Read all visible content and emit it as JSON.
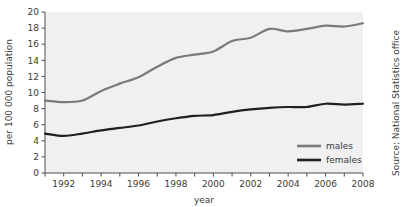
{
  "chart_data": {
    "type": "line",
    "title": "",
    "xlabel": "year",
    "ylabel": "per 100 000 population",
    "x": [
      1991,
      1992,
      1993,
      1994,
      1995,
      1996,
      1997,
      1998,
      1999,
      2000,
      2001,
      2002,
      2003,
      2004,
      2005,
      2006,
      2007,
      2008
    ],
    "xlim": [
      1991,
      2008
    ],
    "ylim": [
      0,
      20
    ],
    "yticks": [
      0,
      2,
      4,
      6,
      8,
      10,
      12,
      14,
      16,
      18,
      20
    ],
    "xticks": [
      1991,
      1992,
      1993,
      1994,
      1995,
      1996,
      1997,
      1998,
      1999,
      2000,
      2001,
      2002,
      2003,
      2004,
      2005,
      2006,
      2007,
      2008
    ],
    "xtick_labels": [
      "",
      "1992",
      "",
      "1994",
      "",
      "1996",
      "",
      "1998",
      "",
      "2000",
      "",
      "2002",
      "",
      "2004",
      "",
      "2006",
      "",
      "2008"
    ],
    "ytick_labels": [
      "0",
      "2",
      "4",
      "6",
      "8",
      "10",
      "12",
      "14",
      "16",
      "18",
      "20"
    ],
    "grid": false,
    "legend_position": "bottom-right",
    "series": [
      {
        "name": "males",
        "color": "#7a7a7a",
        "values": [
          9.0,
          8.8,
          9.0,
          10.2,
          11.1,
          11.9,
          13.2,
          14.3,
          14.7,
          15.1,
          16.4,
          16.8,
          17.9,
          17.6,
          17.9,
          18.3,
          18.2,
          18.6
        ]
      },
      {
        "name": "females",
        "color": "#1f1f1f",
        "values": [
          4.9,
          4.6,
          4.9,
          5.3,
          5.6,
          5.9,
          6.4,
          6.8,
          7.1,
          7.2,
          7.6,
          7.9,
          8.1,
          8.2,
          8.2,
          8.6,
          8.5,
          8.6
        ]
      }
    ],
    "source": "Source: National Statistics office",
    "plot_background": "#f0f0f0",
    "axis_color": "#4d4d4d"
  },
  "legend": {
    "items": [
      {
        "label": "males"
      },
      {
        "label": "females"
      }
    ]
  },
  "axes": {
    "x_title": "year",
    "y_title": "per 100 000 population"
  },
  "source": {
    "text": "Source: National Statistics office"
  }
}
